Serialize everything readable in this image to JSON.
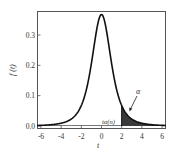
{
  "chart_data": {
    "type": "area",
    "title": "",
    "xlabel": "t",
    "ylabel": "f(t)",
    "xlim": [
      -6.4,
      6.4
    ],
    "ylim": [
      -0.005,
      0.38
    ],
    "xticks": [
      -6,
      -4,
      -2,
      0,
      2,
      4,
      6
    ],
    "xtick_labels": [
      "-6",
      "-4",
      "-2",
      "0",
      "2",
      "4",
      "6"
    ],
    "yticks": [
      0.0,
      0.1,
      0.2,
      0.3
    ],
    "ytick_labels": [
      "0.0",
      "0.1",
      "0.2",
      "0.3"
    ],
    "grid": false,
    "legend": null,
    "series": [
      {
        "name": "Student t density",
        "degrees_of_freedom": 3,
        "x": [
          -6,
          -5,
          -4,
          -3,
          -2,
          -1.5,
          -1,
          -0.5,
          0,
          0.5,
          1,
          1.5,
          2,
          3,
          4,
          5,
          6
        ],
        "values": [
          0.004,
          0.007,
          0.013,
          0.023,
          0.068,
          0.119,
          0.207,
          0.313,
          0.368,
          0.313,
          0.207,
          0.119,
          0.068,
          0.023,
          0.013,
          0.007,
          0.004
        ]
      }
    ],
    "shaded_region": {
      "from": 2,
      "to": 6.4,
      "color": "#3a3a3a"
    },
    "annotations": [
      {
        "text": "α",
        "x": 3.3,
        "y": 0.105,
        "arrow_to": [
          2.6,
          0.035
        ]
      },
      {
        "text": "tα(n)",
        "x": 1.0,
        "y": 0.012
      }
    ]
  },
  "labels": {
    "xlabel": "t",
    "ylabel": "f (t)",
    "alpha": "α",
    "critical": "tα(n)",
    "yticks": [
      "0.0",
      "0.1",
      "0.2",
      "0.3"
    ],
    "xticks": [
      "-6",
      "-4",
      "-2",
      "0",
      "2",
      "4",
      "6"
    ]
  }
}
